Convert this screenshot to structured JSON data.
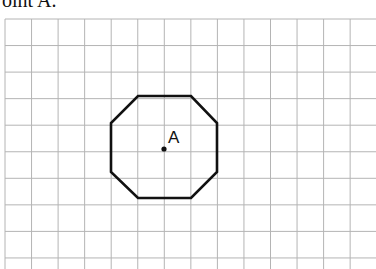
{
  "caption": "oint A.",
  "grid": {
    "x0": 5,
    "y0": 19,
    "cell": 26.55,
    "cols": 14,
    "rows": 10,
    "line_color": "#b4b4b4"
  },
  "shape": {
    "type": "octagon",
    "stroke": "#111111",
    "vertices": [
      [
        138,
        96
      ],
      [
        191,
        96
      ],
      [
        217,
        123
      ],
      [
        217,
        172
      ],
      [
        191,
        198
      ],
      [
        138,
        198
      ],
      [
        111,
        172
      ],
      [
        111,
        123
      ]
    ]
  },
  "point": {
    "label": "A",
    "x": 164,
    "y": 149
  }
}
